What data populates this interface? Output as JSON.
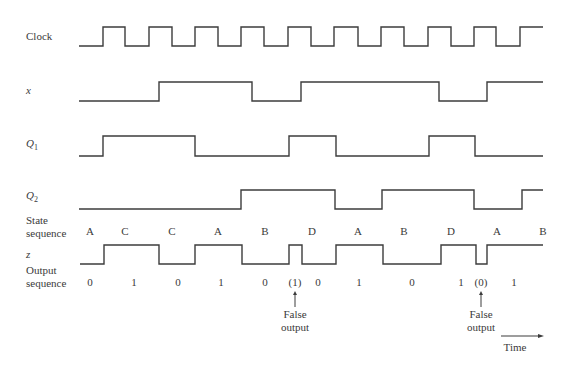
{
  "signals": [
    {
      "name": "Clock",
      "label": "Clock",
      "italic": false,
      "y_high": 27,
      "y_low": 46,
      "start_x": 79,
      "end_x": 543,
      "initial": 0,
      "edges": [
        103,
        125,
        149,
        172,
        195,
        218,
        241,
        264,
        288,
        311,
        334,
        358,
        381,
        404,
        428,
        451,
        474,
        496,
        520
      ]
    },
    {
      "name": "x",
      "label": "x",
      "italic": true,
      "y_high": 82,
      "y_low": 101,
      "start_x": 79,
      "end_x": 543,
      "initial": 0,
      "edges": [
        159,
        252,
        301,
        439,
        487
      ]
    },
    {
      "name": "Q1",
      "label": "Q",
      "sub": "1",
      "italic": true,
      "y_high": 136,
      "y_low": 156,
      "start_x": 79,
      "end_x": 543,
      "initial": 0,
      "edges": [
        103,
        195,
        289,
        336,
        429,
        475
      ]
    },
    {
      "name": "Q2",
      "label": "Q",
      "sub": "2",
      "italic": true,
      "y_high": 190,
      "y_low": 209,
      "start_x": 79,
      "end_x": 543,
      "initial": 0,
      "edges": [
        241,
        335,
        382,
        474,
        522
      ]
    },
    {
      "name": "z",
      "label": "z",
      "italic": true,
      "y_high": 245,
      "y_low": 264,
      "start_x": 80,
      "end_x": 543,
      "initial": 0,
      "edges": [
        104,
        159,
        195,
        242,
        289,
        302,
        336,
        383,
        441,
        476,
        487
      ]
    }
  ],
  "labels": {
    "state_sequence_line1": "State",
    "state_sequence_line2": "sequence",
    "output_sequence_line1": "Output",
    "output_sequence_line2": "sequence",
    "time": "Time"
  },
  "state_sequence": [
    {
      "text": "A",
      "x": 90
    },
    {
      "text": "C",
      "x": 125
    },
    {
      "text": "C",
      "x": 172
    },
    {
      "text": "A",
      "x": 218
    },
    {
      "text": "B",
      "x": 265
    },
    {
      "text": "D",
      "x": 312
    },
    {
      "text": "A",
      "x": 358
    },
    {
      "text": "B",
      "x": 404
    },
    {
      "text": "D",
      "x": 451
    },
    {
      "text": "A",
      "x": 497
    },
    {
      "text": "B",
      "x": 543
    }
  ],
  "output_sequence": [
    {
      "text": "0",
      "x": 90
    },
    {
      "text": "1",
      "x": 134
    },
    {
      "text": "0",
      "x": 178
    },
    {
      "text": "1",
      "x": 221
    },
    {
      "text": "0",
      "x": 265
    },
    {
      "text": "(1)",
      "x": 295
    },
    {
      "text": "0",
      "x": 318
    },
    {
      "text": "1",
      "x": 359
    },
    {
      "text": "0",
      "x": 412
    },
    {
      "text": "1",
      "x": 461
    },
    {
      "text": "(0)",
      "x": 481
    },
    {
      "text": "1",
      "x": 514
    }
  ],
  "annotations": [
    {
      "line1": "False",
      "line2": "output",
      "x": 295,
      "arrow_top": 291,
      "arrow_bottom": 307
    },
    {
      "line1": "False",
      "line2": "output",
      "x": 481,
      "arrow_top": 291,
      "arrow_bottom": 307
    }
  ],
  "time_arrow": {
    "x1": 501,
    "x2": 544,
    "y": 336
  },
  "colors": {
    "line": "#3c3c3c",
    "text": "#3a3a3a",
    "background": "#ffffff"
  }
}
